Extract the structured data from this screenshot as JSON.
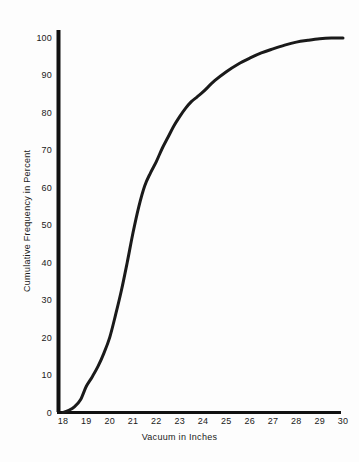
{
  "chart_data": {
    "type": "line",
    "title": "",
    "subtitle": "",
    "xlabel": "Vacuum in Inches",
    "ylabel": "Cumulative Frequency in Percent",
    "xlim": [
      17.6,
      30.6
    ],
    "ylim": [
      0,
      102
    ],
    "grid": false,
    "legend": null,
    "annotations": [],
    "xticks": [
      "18",
      "19",
      "20",
      "21",
      "22",
      "23",
      "24",
      "25",
      "26",
      "27",
      "28",
      "29",
      "30"
    ],
    "xtick_values": [
      18,
      19,
      20,
      21,
      22,
      23,
      24,
      25,
      26,
      27,
      28,
      29,
      30
    ],
    "yticks": [
      "0",
      "10",
      "20",
      "30",
      "40",
      "50",
      "60",
      "70",
      "80",
      "90",
      "100"
    ],
    "ytick_values": [
      0,
      10,
      20,
      30,
      40,
      50,
      60,
      70,
      80,
      90,
      100
    ],
    "series": [
      {
        "name": "Cumulative Frequency",
        "color": "#1a1a1a",
        "line_width": 3,
        "x": [
          18.0,
          18.25,
          18.5,
          18.75,
          19.0,
          19.25,
          19.5,
          19.75,
          20.0,
          20.25,
          20.5,
          20.75,
          21.0,
          21.25,
          21.5,
          21.75,
          22.0,
          22.25,
          22.5,
          22.75,
          23.0,
          23.25,
          23.5,
          23.75,
          24.0,
          24.5,
          25.0,
          25.5,
          26.0,
          26.5,
          27.0,
          27.5,
          28.0,
          28.5,
          29.0,
          29.5,
          30.0
        ],
        "y": [
          0.0,
          0.6,
          1.6,
          3.4,
          7.0,
          9.5,
          12.3,
          15.8,
          20.0,
          26.0,
          32.5,
          40.0,
          48.0,
          55.0,
          60.5,
          64.0,
          67.0,
          70.5,
          73.5,
          76.5,
          79.0,
          81.2,
          83.0,
          84.3,
          85.6,
          88.6,
          91.0,
          93.0,
          94.6,
          96.0,
          97.1,
          98.1,
          98.9,
          99.4,
          99.8,
          100.0,
          100.0
        ]
      }
    ]
  },
  "axis": {
    "x_title": "Vacuum in Inches",
    "y_title": "Cumulative Frequency in Percent"
  },
  "colors": {
    "background": "#fdfdfd",
    "axis": "#111111",
    "curve": "#1a1a1a",
    "text": "#1a1a1a"
  }
}
